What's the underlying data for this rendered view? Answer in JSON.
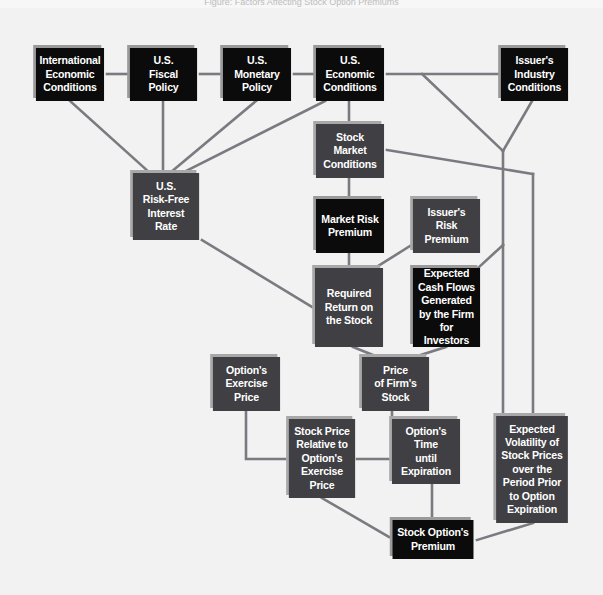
{
  "header": {
    "running_text": "Figure: Factors Affecting Stock Option Premiums"
  },
  "diagram": {
    "colors": {
      "background": "#f2f2f2",
      "primary_node": "#0b0b0b",
      "secondary_node": "#3f3f44",
      "connector": "#7a7a80",
      "node_text": "#ffffff"
    },
    "nodes": {
      "international_economic_conditions": "International\nEconomic\nConditions",
      "us_fiscal_policy": "U.S.\nFiscal\nPolicy",
      "us_monetary_policy": "U.S.\nMonetary\nPolicy",
      "us_economic_conditions": "U.S.\nEconomic\nConditions",
      "issuers_industry_conditions": "Issuer's\nIndustry\nConditions",
      "stock_market_conditions": "Stock\nMarket\nConditions",
      "us_risk_free_interest_rate": "U.S.\nRisk-Free\nInterest\nRate",
      "market_risk_premium": "Market Risk\nPremium",
      "issuers_risk_premium": "Issuer's\nRisk\nPremium",
      "required_return_on_stock": "Required\nReturn on\nthe Stock",
      "expected_cash_flows": "Expected\nCash Flows\nGenerated\nby the Firm\nfor Investors",
      "options_exercise_price": "Option's\nExercise\nPrice",
      "price_of_firms_stock": "Price\nof Firm's\nStock",
      "stock_price_relative_to_exercise": "Stock Price\nRelative to\nOption's\nExercise\nPrice",
      "options_time_until_expiration": "Option's\nTime\nuntil\nExpiration",
      "expected_volatility": "Expected\nVolatility of\nStock Prices\nover the\nPeriod Prior\nto Option\nExpiration",
      "stock_options_premium": "Stock Option's\nPremium"
    },
    "edges": [
      [
        "us_fiscal_policy",
        "international_economic_conditions"
      ],
      [
        "us_monetary_policy",
        "us_fiscal_policy"
      ],
      [
        "us_economic_conditions",
        "us_monetary_policy"
      ],
      [
        "us_economic_conditions",
        "issuers_industry_conditions"
      ],
      [
        "international_economic_conditions",
        "us_risk_free_interest_rate"
      ],
      [
        "us_fiscal_policy",
        "us_risk_free_interest_rate"
      ],
      [
        "us_monetary_policy",
        "us_risk_free_interest_rate"
      ],
      [
        "us_economic_conditions",
        "us_risk_free_interest_rate"
      ],
      [
        "us_economic_conditions",
        "stock_market_conditions"
      ],
      [
        "us_economic_conditions",
        "expected_cash_flows"
      ],
      [
        "issuers_industry_conditions",
        "expected_cash_flows"
      ],
      [
        "stock_market_conditions",
        "market_risk_premium"
      ],
      [
        "stock_market_conditions",
        "expected_volatility"
      ],
      [
        "issuers_industry_conditions",
        "expected_volatility"
      ],
      [
        "us_risk_free_interest_rate",
        "required_return_on_stock"
      ],
      [
        "market_risk_premium",
        "required_return_on_stock"
      ],
      [
        "issuers_risk_premium",
        "required_return_on_stock"
      ],
      [
        "required_return_on_stock",
        "price_of_firms_stock"
      ],
      [
        "expected_cash_flows",
        "price_of_firms_stock"
      ],
      [
        "options_exercise_price",
        "stock_price_relative_to_exercise"
      ],
      [
        "price_of_firms_stock",
        "stock_price_relative_to_exercise"
      ],
      [
        "stock_price_relative_to_exercise",
        "stock_options_premium"
      ],
      [
        "options_time_until_expiration",
        "stock_options_premium"
      ],
      [
        "expected_volatility",
        "stock_options_premium"
      ]
    ]
  }
}
